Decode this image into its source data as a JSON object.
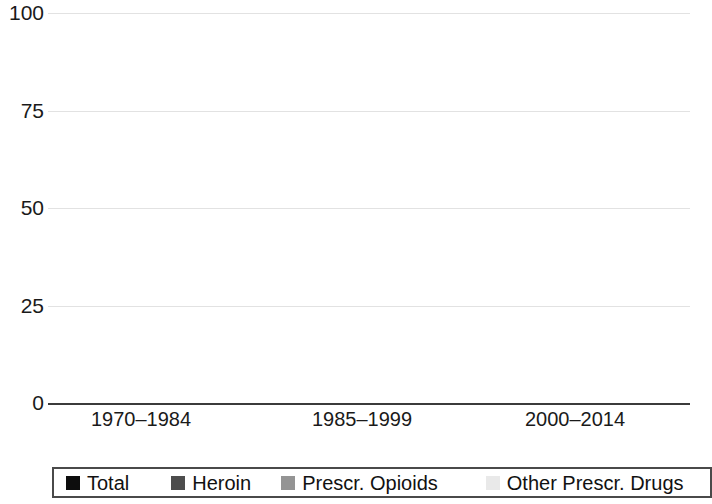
{
  "chart_data": {
    "type": "bar",
    "title": "",
    "subtitle": "",
    "xlabel": "",
    "ylabel": "",
    "ylim": [
      0,
      100
    ],
    "yticks": [
      0,
      25,
      50,
      75,
      100
    ],
    "ytick_labels": [
      "0",
      "25",
      "50",
      "75",
      "100"
    ],
    "grid": true,
    "grid_axis": "y",
    "legend_position": "bottom",
    "categories": [
      "1970–1984",
      "1985–1999",
      "2000–2014"
    ],
    "series": [
      {
        "name": "Total",
        "color": "#0d0d0d",
        "values": [
          55,
          64,
          98
        ]
      },
      {
        "name": "Heroin",
        "color": "#4d4d4d",
        "values": [
          26,
          28,
          30
        ]
      },
      {
        "name": "Prescr. Opioids",
        "color": "#949494",
        "values": [
          11.5,
          13,
          19
        ]
      },
      {
        "name": "Other Prescr. Drugs",
        "color": "#e9e9e9",
        "values": [
          22,
          27,
          47.5
        ]
      }
    ]
  },
  "axis": {
    "y_ticks": [
      {
        "label": "100",
        "value": 100
      },
      {
        "label": "75",
        "value": 75
      },
      {
        "label": "50",
        "value": 50
      },
      {
        "label": "25",
        "value": 25
      },
      {
        "label": "0",
        "value": 0
      }
    ],
    "x_labels": [
      "1970–1984",
      "1985–1999",
      "2000–2014"
    ]
  },
  "legend": {
    "items": [
      {
        "label": "Total",
        "swatch": "legend-swatch-total",
        "color": "#0d0d0d"
      },
      {
        "label": "Heroin",
        "swatch": "legend-swatch-heroin",
        "color": "#4d4d4d"
      },
      {
        "label": "Prescr. Opioids",
        "swatch": "legend-swatch-prescr-opioids",
        "color": "#949494"
      },
      {
        "label": "Other Prescr. Drugs",
        "swatch": "legend-swatch-other-prescr-drugs",
        "color": "#e9e9e9"
      }
    ]
  }
}
